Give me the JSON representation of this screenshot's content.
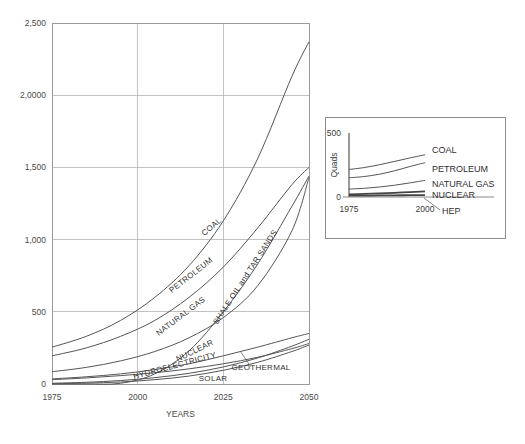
{
  "chart_data": [
    {
      "id": "main",
      "type": "line",
      "title": "",
      "xlabel": "YEARS",
      "ylabel": "",
      "xlim": [
        1975,
        2050
      ],
      "ylim": [
        0,
        2500
      ],
      "grid": true,
      "legend_position": "inline-curve-labels",
      "xticks": [
        "1975",
        "2000",
        "2025",
        "2050"
      ],
      "xtick_values": [
        1975,
        2000,
        2025,
        2050
      ],
      "yticks": [
        "0",
        "500",
        "1,000",
        "1,500",
        "2,0000",
        "2,500"
      ],
      "ytick_values": [
        0,
        500,
        1000,
        1500,
        2000,
        2500
      ],
      "x": [
        1975,
        1985,
        1995,
        2005,
        2015,
        2025,
        2035,
        2045,
        2050
      ],
      "series": [
        {
          "name": "COAL",
          "values": [
            255,
            330,
            440,
            600,
            820,
            1130,
            1560,
            2130,
            2370
          ],
          "label_x": 2022,
          "label_y": 1075,
          "label_rotation": -40
        },
        {
          "name": "PETROLEUM",
          "values": [
            195,
            250,
            330,
            440,
            600,
            810,
            1080,
            1380,
            1500
          ],
          "label_x": 2016,
          "label_y": 740,
          "label_rotation": -38
        },
        {
          "name": "NATURAL GAS",
          "values": [
            85,
            115,
            160,
            225,
            320,
            460,
            680,
            1060,
            1430
          ],
          "label_x": 2013,
          "label_y": 455,
          "label_rotation": -37
        },
        {
          "name": "NUCLEAR",
          "values": [
            35,
            50,
            70,
            100,
            140,
            195,
            255,
            320,
            350
          ],
          "label_x": 2017,
          "label_y": 215,
          "label_rotation": -26
        },
        {
          "name": "SHALE OIL and TAR SANDS",
          "values": [
            0,
            0,
            5,
            70,
            230,
            500,
            830,
            1230,
            1440
          ],
          "label_x": 2032,
          "label_y": 730,
          "label_rotation": -57
        },
        {
          "name": "HYDROELECTRICITY",
          "values": [
            30,
            42,
            58,
            78,
            105,
            140,
            185,
            245,
            280
          ],
          "label_x": 2011,
          "label_y": 110,
          "label_rotation": -15
        },
        {
          "name": "SOLAR",
          "values": [
            2,
            6,
            14,
            30,
            55,
            95,
            150,
            225,
            270
          ],
          "label_x": 2022,
          "label_y": 18,
          "label_rotation": 0
        },
        {
          "name": "GEOTHERMAL",
          "values": [
            5,
            12,
            24,
            44,
            74,
            118,
            180,
            262,
            310
          ],
          "label_x": 2036,
          "label_y": 95,
          "label_rotation": 0
        }
      ]
    },
    {
      "id": "inset",
      "type": "line",
      "title": "",
      "xlabel": "",
      "ylabel": "Quads",
      "xlim": [
        1975,
        2000
      ],
      "ylim": [
        0,
        500
      ],
      "grid": false,
      "legend_position": "right-of-curves",
      "xticks": [
        "1975",
        "2000"
      ],
      "xtick_values": [
        1975,
        2000
      ],
      "yticks": [
        "0",
        "500"
      ],
      "ytick_values": [
        0,
        500
      ],
      "x": [
        1975,
        1980,
        1985,
        1990,
        1995,
        2000
      ],
      "series": [
        {
          "name": "COAL",
          "values": [
            215,
            230,
            252,
            278,
            305,
            330
          ]
        },
        {
          "name": "PETROLEUM",
          "values": [
            150,
            160,
            178,
            205,
            238,
            268
          ]
        },
        {
          "name": "NATURAL GAS",
          "values": [
            62,
            68,
            78,
            92,
            110,
            130
          ]
        },
        {
          "name": "NUCLEAR",
          "values": [
            20,
            24,
            28,
            33,
            38,
            44
          ]
        },
        {
          "name": "HEP",
          "values": [
            10,
            11,
            12,
            13,
            14,
            15
          ]
        }
      ]
    }
  ]
}
